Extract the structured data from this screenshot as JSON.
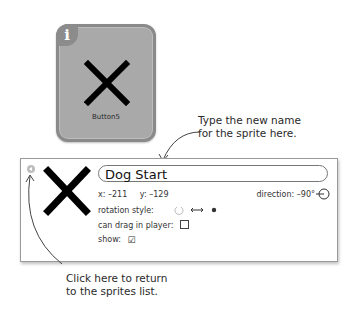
{
  "sprite_tile": {
    "info_badge": "i",
    "icon": "x-cross-icon",
    "label": "Button5",
    "colors": {
      "background": "#a9a9a9",
      "border": "#8a8a8a"
    }
  },
  "callouts": {
    "rename_line1": "Type the new name",
    "rename_line2": "for the sprite here.",
    "back_line1": "Click here to return",
    "back_line2": "to the sprites list."
  },
  "info_panel": {
    "back_button_icon": "back-arrow-icon",
    "sprite_icon": "x-cross-icon",
    "name_value": "Dog Start",
    "x_label": "x:",
    "x_value": "–211",
    "y_label": "y:",
    "y_value": "–129",
    "direction_label": "direction:",
    "direction_value": "–90°",
    "rotation_style_label": "rotation style:",
    "rotation_options": [
      "rotate-icon",
      "left-right-icon",
      "dont-rotate-icon"
    ],
    "can_drag_label": "can drag in player:",
    "can_drag_checked": false,
    "show_label": "show:",
    "show_checked": true,
    "show_check_glyph": "☑"
  }
}
